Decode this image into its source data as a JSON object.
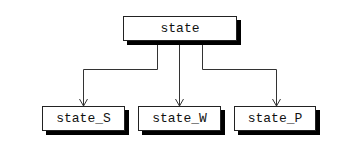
{
  "diagram": {
    "root": {
      "label": "state"
    },
    "children": [
      {
        "label": "state_S"
      },
      {
        "label": "state_W"
      },
      {
        "label": "state_P"
      }
    ],
    "colors": {
      "line": "#333333",
      "shadow": "#000000",
      "box_fill": "#ffffff"
    }
  }
}
